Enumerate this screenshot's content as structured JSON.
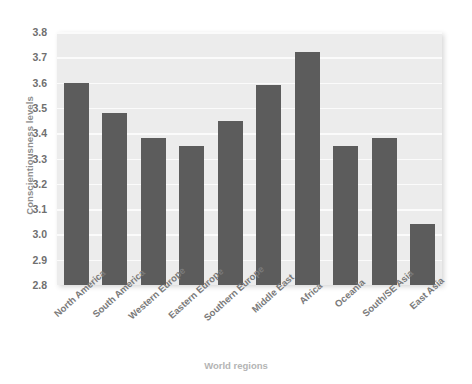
{
  "chart_data": {
    "type": "bar",
    "title": "",
    "xlabel": "World regions",
    "ylabel": "Conscientiousness levels",
    "ylim": [
      2.8,
      3.8
    ],
    "ytick_labels": [
      "3.8",
      "3.7",
      "3.6",
      "3.5",
      "3.4",
      "3.3",
      "3.2",
      "3.1",
      "3.0",
      "2.9",
      "2.8"
    ],
    "yticks": [
      3.8,
      3.7,
      3.6,
      3.5,
      3.4,
      3.3,
      3.2,
      3.1,
      3.0,
      2.9,
      2.8
    ],
    "grid": true,
    "legend": "none",
    "bar_color": "#5c5c5c",
    "plot_background": "#ececec",
    "categories": [
      "North America",
      "South America",
      "Western Europe",
      "Eastern Europe",
      "Southern Europe",
      "Middle East",
      "Africa",
      "Oceania",
      "South/SE Asia",
      "East Asia"
    ],
    "values": [
      3.6,
      3.48,
      3.38,
      3.35,
      3.45,
      3.59,
      3.72,
      3.35,
      3.38,
      3.04
    ]
  }
}
